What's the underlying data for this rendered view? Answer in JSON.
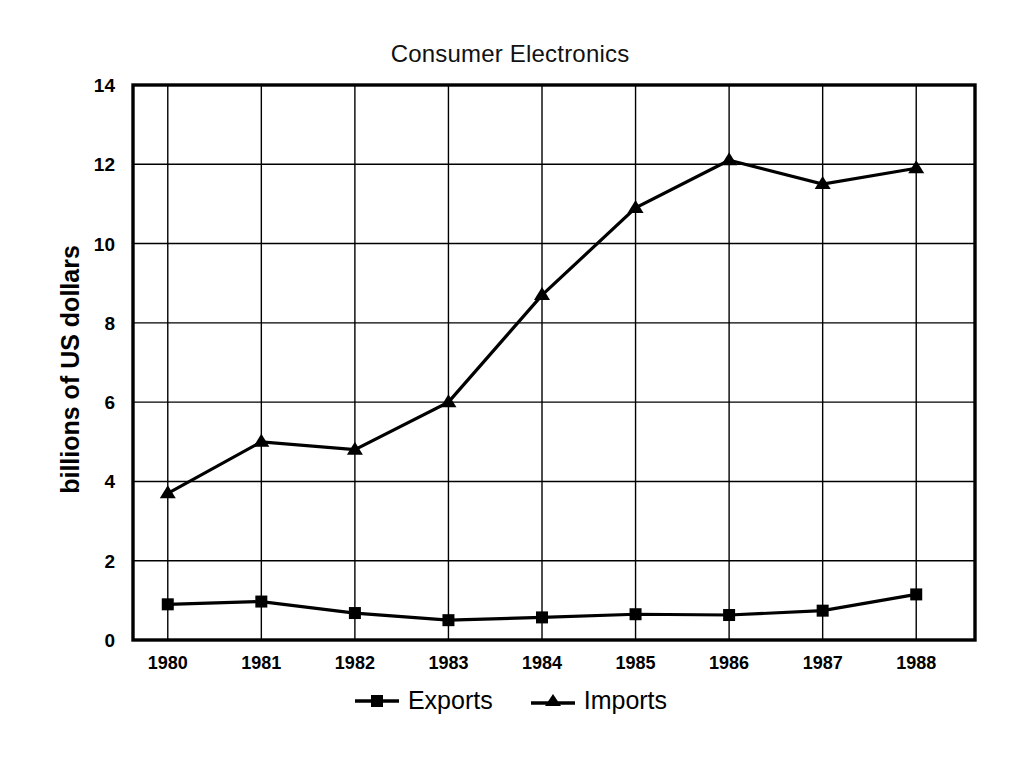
{
  "chart_data": {
    "type": "line",
    "title": "Consumer Electronics",
    "xlabel": "",
    "ylabel": "billions of US dollars",
    "categories": [
      "1980",
      "1981",
      "1982",
      "1983",
      "1984",
      "1985",
      "1986",
      "1987",
      "1988"
    ],
    "x": [
      1980,
      1981,
      1982,
      1983,
      1984,
      1985,
      1986,
      1987,
      1988
    ],
    "ylim": [
      0,
      14
    ],
    "yticks": [
      0,
      2,
      4,
      6,
      8,
      10,
      12,
      14
    ],
    "ytick_labels": [
      "0",
      "2",
      "4",
      "6",
      "8",
      "10",
      "12",
      "14"
    ],
    "grid": true,
    "legend_position": "bottom",
    "series": [
      {
        "name": "Exports",
        "marker": "square",
        "color": "#000000",
        "values": [
          0.9,
          0.97,
          0.68,
          0.5,
          0.57,
          0.65,
          0.63,
          0.74,
          1.15
        ]
      },
      {
        "name": "Imports",
        "marker": "triangle",
        "color": "#000000",
        "values": [
          3.7,
          5.0,
          4.8,
          6.0,
          8.7,
          10.9,
          12.1,
          11.5,
          11.9
        ]
      }
    ]
  },
  "legend": {
    "entries": [
      {
        "label": "Exports",
        "marker": "square-marker-icon"
      },
      {
        "label": "Imports",
        "marker": "triangle-marker-icon"
      }
    ]
  }
}
